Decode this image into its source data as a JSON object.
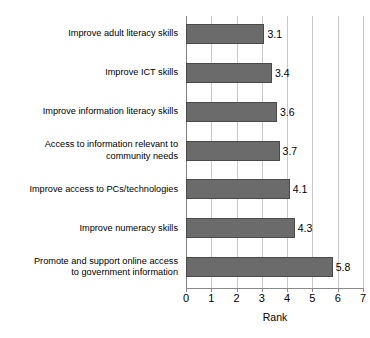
{
  "chart_data": {
    "type": "bar",
    "orientation": "horizontal",
    "title": "",
    "xlabel": "Rank",
    "ylabel": "",
    "xlim": [
      0,
      7
    ],
    "xticks": [
      "0",
      "1",
      "2",
      "3",
      "4",
      "5",
      "6",
      "7"
    ],
    "grid": true,
    "legend": null,
    "bar_color": "#6b6b6b",
    "gridline_color": "#c9c9c9",
    "axis_color": "#8a8a8a",
    "categories": [
      "Improve adult literacy skills",
      "Improve ICT skills",
      "Improve information literacy skills",
      "Access to information relevant to\ncommunity needs",
      "Improve access to PCs/technologies",
      "Improve numeracy skills",
      "Promote and support online access\nto government information"
    ],
    "category_lines": [
      [
        "Improve adult literacy skills"
      ],
      [
        "Improve ICT skills"
      ],
      [
        "Improve information literacy skills"
      ],
      [
        "Access to information relevant to",
        "community needs"
      ],
      [
        "Improve access to PCs/technologies"
      ],
      [
        "Improve numeracy skills"
      ],
      [
        "Promote and support online access",
        "to government information"
      ]
    ],
    "values": [
      3.1,
      3.4,
      3.6,
      3.7,
      4.1,
      4.3,
      5.8
    ],
    "value_labels": [
      "3.1",
      "3.4",
      "3.6",
      "3.7",
      "4.1",
      "4.3",
      "5.8"
    ]
  }
}
